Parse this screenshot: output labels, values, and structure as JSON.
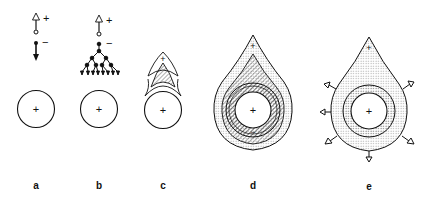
{
  "figure": {
    "panels": [
      {
        "label": "a",
        "center_symbol": "+",
        "top_symbols": [
          "+",
          "−"
        ],
        "description": "single positive charge carrier moves up, single negative moves down"
      },
      {
        "label": "b",
        "center_symbol": "+",
        "top_symbols": [
          "+",
          "−"
        ],
        "description": "negative carrier branching avalanche"
      },
      {
        "label": "c",
        "center_symbol": "+",
        "tip_symbol": "+",
        "description": "streamer head forming above sphere"
      },
      {
        "label": "d",
        "center_symbol": "+",
        "tip_symbol": "+",
        "bottom_symbol": "−",
        "description": "teardrop-shaped discharge with hatched layers"
      },
      {
        "label": "e",
        "center_symbol": "+",
        "tip_symbol": "+",
        "description": "dotted teardrop region with outward arrows"
      }
    ],
    "caption_partial": ""
  }
}
